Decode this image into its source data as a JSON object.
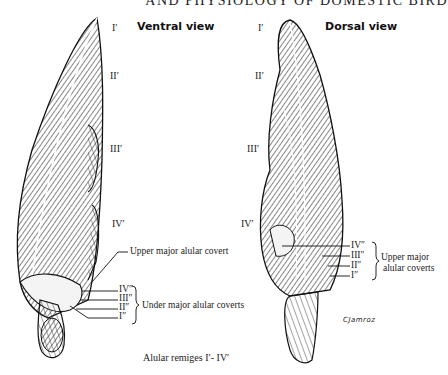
{
  "page": {
    "running_head": "AND PHYSIOLOGY OF DOMESTIC BIRD"
  },
  "ventral": {
    "title": "Ventral view",
    "remiges": [
      "I′",
      "II′",
      "III′",
      "IV′"
    ],
    "upper_covert_label": "Upper major alular covert",
    "under_coverts": [
      "IV″",
      "III″",
      "II″",
      "I″"
    ],
    "under_coverts_label": "Under major  alular coverts"
  },
  "dorsal": {
    "title": "Dorsal view",
    "remiges": [
      "I′",
      "II′",
      "III′",
      "IV′"
    ],
    "upper_coverts": [
      "IV″",
      "III″",
      "II″",
      "I″"
    ],
    "upper_coverts_label_line1": "Upper major",
    "upper_coverts_label_line2": "alular coverts"
  },
  "caption": "Alular remiges  I′- IV′",
  "signature": "CJamroz"
}
